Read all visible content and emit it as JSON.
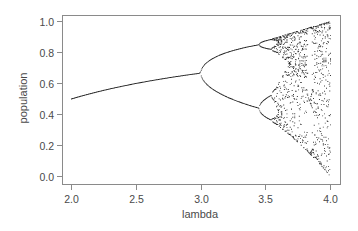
{
  "chart_data": {
    "type": "scatter",
    "title": "",
    "xlabel": "lambda",
    "ylabel": "population",
    "xlim": [
      1.95,
      4.05
    ],
    "ylim": [
      -0.02,
      1.04
    ],
    "x_ticks": [
      2.0,
      2.5,
      3.0,
      3.5,
      4.0
    ],
    "x_tick_labels": [
      "2.0",
      "2.5",
      "3.0",
      "3.5",
      "4.0"
    ],
    "y_ticks": [
      0.0,
      0.2,
      0.4,
      0.6,
      0.8,
      1.0
    ],
    "y_tick_labels": [
      "0.0",
      "0.2",
      "0.4",
      "0.6",
      "0.8",
      "1.0"
    ],
    "grid": false,
    "legend": null,
    "model": {
      "equation": "x_next = lambda * x * (1 - x)",
      "lambda_range": [
        2.0,
        4.0
      ],
      "lambda_samples": 400,
      "initial_x": 0.5,
      "transient_iterations": 300,
      "plotted_iterations": 12
    },
    "series": [
      {
        "name": "fixed point (period 1)",
        "x": [
          2.0,
          2.2,
          2.4,
          2.6,
          2.8,
          3.0
        ],
        "y": [
          0.5,
          0.545,
          0.583,
          0.615,
          0.643,
          0.667
        ]
      },
      {
        "name": "period-2 upper branch",
        "x": [
          3.0,
          3.1,
          3.2,
          3.3,
          3.4,
          3.45
        ],
        "y": [
          0.667,
          0.765,
          0.799,
          0.824,
          0.842,
          0.849
        ]
      },
      {
        "name": "period-2 lower branch",
        "x": [
          3.0,
          3.1,
          3.2,
          3.3,
          3.4,
          3.45
        ],
        "y": [
          0.667,
          0.558,
          0.513,
          0.479,
          0.452,
          0.44
        ]
      },
      {
        "name": "chaotic region envelope",
        "x": [
          3.57,
          3.7,
          3.8,
          3.9,
          4.0
        ],
        "y_max": [
          0.893,
          0.925,
          0.95,
          0.975,
          1.0
        ],
        "y_min": [
          0.3,
          0.23,
          0.18,
          0.095,
          0.0
        ]
      }
    ]
  },
  "axes": {
    "x_title": "lambda",
    "y_title": "population"
  }
}
